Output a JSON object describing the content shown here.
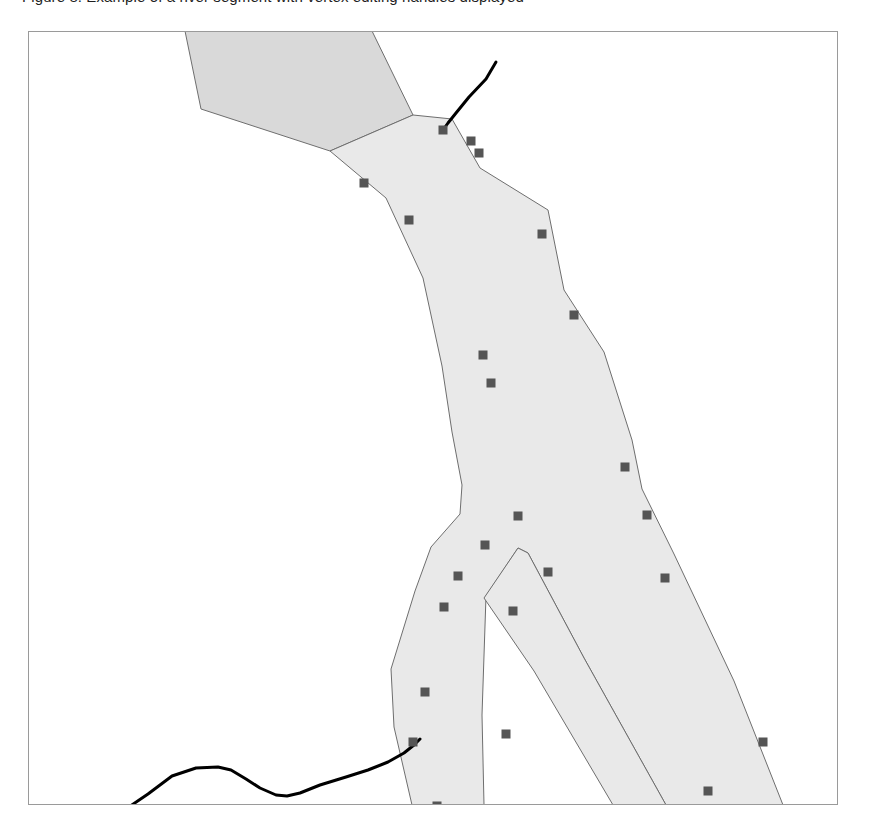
{
  "caption": {
    "text": "Figure 8. Example of a river segment with vertex editing handles displayed"
  },
  "map": {
    "frame": {
      "x": 28,
      "y": 31,
      "width": 810,
      "height": 774
    },
    "background_color": "#ffffff",
    "border_color": "#9a9a9a",
    "title": "Map Feature Editor Canvas"
  },
  "styles": {
    "polygon_fill": "#e9e9e9",
    "polygon_fill_upper": "#d9d9d9",
    "polygon_stroke": "#6e6e6e",
    "line_stroke": "#000000",
    "vertex_fill": "#555555",
    "vertex_size": 9
  },
  "features": [
    {
      "name": "river-polygon-upper-branch",
      "type": "polygon",
      "fill": "#d9d9d9",
      "points": "157,0 344,0 385,84 302,120 173,78"
    },
    {
      "name": "river-polygon-main",
      "type": "polygon",
      "fill": "#e9e9e9",
      "points": "385,84 424,88 452,137 520,179 536,259 576,321 604,409 614,458 646,523 706,650 755,774 638,774 556,627 500,522 490,517 458,565 454,684 456,774 384,774 366,696 363,638 387,560 403,516 432,483 434,454 424,401 414,335 395,247 358,167 302,120"
    },
    {
      "name": "river-polygon-fork-lower-left",
      "type": "polygon",
      "fill": "#e9e9e9",
      "points": "490,517 500,522 556,627 638,774 585,774 506,640 456,567"
    }
  ],
  "lines": [
    {
      "name": "stream-line-top",
      "type": "polyline",
      "points": "468,31 458,48 441,66 428,82 420,92 415,99"
    },
    {
      "name": "stream-line-bottom",
      "type": "polyline",
      "points": "58,804 70,795 95,780 120,763 144,745 168,737 190,736 203,739 218,748 232,757 248,764 259,765 272,762 292,754 318,746 340,739 360,731 376,722 386,714 390,710 392,708"
    }
  ],
  "vertices": [
    {
      "name": "vertex-01",
      "x": 336,
      "y": 152
    },
    {
      "name": "vertex-02",
      "x": 415,
      "y": 99
    },
    {
      "name": "vertex-03",
      "x": 443,
      "y": 110
    },
    {
      "name": "vertex-04",
      "x": 451,
      "y": 122
    },
    {
      "name": "vertex-05",
      "x": 381,
      "y": 189
    },
    {
      "name": "vertex-06",
      "x": 514,
      "y": 203
    },
    {
      "name": "vertex-07",
      "x": 546,
      "y": 284
    },
    {
      "name": "vertex-08",
      "x": 455,
      "y": 324
    },
    {
      "name": "vertex-09",
      "x": 463,
      "y": 352
    },
    {
      "name": "vertex-10",
      "x": 597,
      "y": 436
    },
    {
      "name": "vertex-11",
      "x": 490,
      "y": 485
    },
    {
      "name": "vertex-12",
      "x": 619,
      "y": 484
    },
    {
      "name": "vertex-13",
      "x": 457,
      "y": 514
    },
    {
      "name": "vertex-14",
      "x": 430,
      "y": 545
    },
    {
      "name": "vertex-15",
      "x": 520,
      "y": 541
    },
    {
      "name": "vertex-16",
      "x": 637,
      "y": 547
    },
    {
      "name": "vertex-17",
      "x": 416,
      "y": 576
    },
    {
      "name": "vertex-18",
      "x": 485,
      "y": 580
    },
    {
      "name": "vertex-19",
      "x": 397,
      "y": 661
    },
    {
      "name": "vertex-20",
      "x": 385,
      "y": 711
    },
    {
      "name": "vertex-21",
      "x": 478,
      "y": 703
    },
    {
      "name": "vertex-22",
      "x": 735,
      "y": 711
    },
    {
      "name": "vertex-23",
      "x": 409,
      "y": 775
    },
    {
      "name": "vertex-24",
      "x": 680,
      "y": 760
    }
  ]
}
